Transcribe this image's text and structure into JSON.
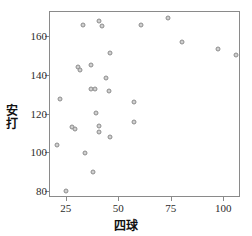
{
  "chart_data": {
    "type": "scatter",
    "title": "",
    "xlabel": "四球",
    "ylabel": "安打",
    "xlim": [
      17,
      108
    ],
    "ylim": [
      77,
      173
    ],
    "xticks": [
      25,
      50,
      75,
      100
    ],
    "yticks": [
      80,
      100,
      120,
      140,
      160
    ],
    "grid": false,
    "legend": null,
    "marker": {
      "shape": "circle",
      "fill": "#cfcfcf",
      "edge": "#8d8d8d",
      "size": 5
    },
    "points": [
      {
        "x": 32.5,
        "y": 166.5
      },
      {
        "x": 40.4,
        "y": 168.3
      },
      {
        "x": 41.9,
        "y": 165.7
      },
      {
        "x": 60.3,
        "y": 166.2
      },
      {
        "x": 73.3,
        "y": 170.0
      },
      {
        "x": 79.9,
        "y": 157.4
      },
      {
        "x": 96.9,
        "y": 154.1
      },
      {
        "x": 105.8,
        "y": 150.8
      },
      {
        "x": 45.5,
        "y": 151.7
      },
      {
        "x": 36.3,
        "y": 145.5
      },
      {
        "x": 30.4,
        "y": 144.4
      },
      {
        "x": 31.2,
        "y": 143.3
      },
      {
        "x": 43.9,
        "y": 138.8
      },
      {
        "x": 36.6,
        "y": 133.3
      },
      {
        "x": 38.5,
        "y": 133.3
      },
      {
        "x": 45.2,
        "y": 132.0
      },
      {
        "x": 21.7,
        "y": 128.2
      },
      {
        "x": 57.0,
        "y": 126.5
      },
      {
        "x": 38.9,
        "y": 121.1
      },
      {
        "x": 57.1,
        "y": 116.3
      },
      {
        "x": 27.7,
        "y": 113.9
      },
      {
        "x": 29.0,
        "y": 112.5
      },
      {
        "x": 40.3,
        "y": 114.2
      },
      {
        "x": 40.4,
        "y": 111.1
      },
      {
        "x": 45.7,
        "y": 108.5
      },
      {
        "x": 20.4,
        "y": 104.3
      },
      {
        "x": 33.6,
        "y": 100.2
      },
      {
        "x": 37.3,
        "y": 90.2
      },
      {
        "x": 24.5,
        "y": 80.4
      }
    ]
  },
  "axis_labels": {
    "y_axis_title": "安打",
    "x_axis_title": "四球"
  },
  "tick_text": {
    "y": [
      "160",
      "140",
      "120",
      "100",
      "80"
    ],
    "x": [
      "25",
      "50",
      "75",
      "100"
    ]
  },
  "colors": {
    "frame": "#8a8a8a",
    "marker_fill": "#cfcfcf",
    "marker_edge": "#8d8d8d",
    "text": "#2b2b2b",
    "background": "#ffffff"
  }
}
